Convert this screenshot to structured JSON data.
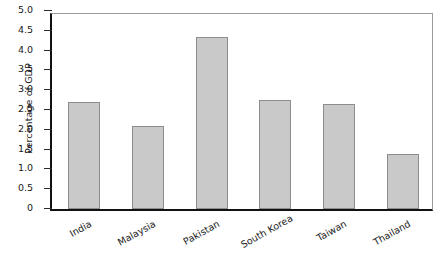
{
  "chart_data": {
    "type": "bar",
    "title": "",
    "xlabel": "",
    "ylabel": "Percentage of GDP",
    "categories": [
      "India",
      "Malaysia",
      "Pakistan",
      "South Korea",
      "Taiwan",
      "Thailand"
    ],
    "values": [
      2.7,
      2.1,
      4.35,
      2.75,
      2.65,
      1.4
    ],
    "ylim": [
      0,
      5.0
    ],
    "ytick_labels": [
      "0",
      "0.5",
      "1.0",
      "1.5",
      "2.0",
      "2.5",
      "3.0",
      "3.5",
      "4.0",
      "4.5",
      "5.0"
    ],
    "ytick_values": [
      0,
      0.5,
      1.0,
      1.5,
      2.0,
      2.5,
      3.0,
      3.5,
      4.0,
      4.5,
      5.0
    ],
    "grid": false,
    "legend": null,
    "bar_color": "#c9c9c9",
    "bar_edge_color": "#8d8d8d",
    "axis_color": "#121212"
  }
}
